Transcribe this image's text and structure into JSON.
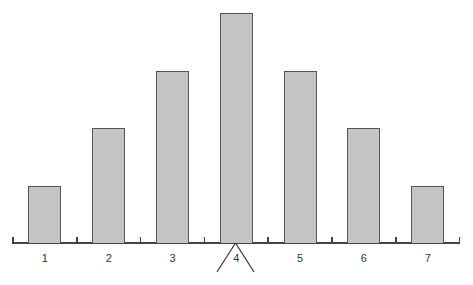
{
  "chart_data": {
    "type": "bar",
    "title": "",
    "xlabel": "",
    "ylabel": "",
    "categories": [
      "1",
      "2",
      "3",
      "4",
      "5",
      "6",
      "7"
    ],
    "values": [
      1,
      2,
      3,
      4,
      3,
      2,
      1
    ],
    "ylim": [
      0,
      4
    ],
    "grid": false,
    "legend": null,
    "bar_color": "#c4c4c4",
    "bar_edge_color": "#555555",
    "annotations": [
      {
        "type": "pivot-marker",
        "at_category": "4",
        "shape": "inverted-V (fulcrum) below x-axis"
      }
    ]
  }
}
